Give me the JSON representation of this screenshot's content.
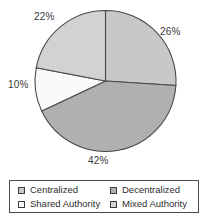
{
  "chart_data": {
    "type": "pie",
    "title": "",
    "categories": [
      "Centralized",
      "Decentralized",
      "Shared Authority",
      "Mixed Authority"
    ],
    "values": [
      26,
      42,
      10,
      22
    ],
    "value_labels": [
      "26%",
      "42%",
      "10%",
      "22%"
    ],
    "unit": "percent",
    "total": 100,
    "start_angle_deg": 0,
    "direction": "clockwise",
    "legend_position": "bottom",
    "legend_columns": 2,
    "grid": false,
    "colors": [
      "#c8c8c8",
      "#b0b0b0",
      "#fafafa",
      "#d2d2d2"
    ],
    "outline_color": "#4a4a4a",
    "slices": [
      {
        "label": "Centralized",
        "value": 26,
        "display": "26%",
        "color": "#c8c8c8"
      },
      {
        "label": "Decentralized",
        "value": 42,
        "display": "42%",
        "color": "#b0b0b0"
      },
      {
        "label": "Shared Authority",
        "value": 10,
        "display": "10%",
        "color": "#fafafa"
      },
      {
        "label": "Mixed Authority",
        "value": 22,
        "display": "22%",
        "color": "#d2d2d2"
      }
    ]
  },
  "legend": {
    "rows": [
      {
        "left": {
          "label": "Centralized",
          "color": "#c8c8c8"
        },
        "right": {
          "label": "Decentralized",
          "color": "#b0b0b0"
        }
      },
      {
        "left": {
          "label": "Shared Authority",
          "color": "#fafafa"
        },
        "right": {
          "label": "Mixed Authority",
          "color": "#d2d2d2"
        }
      }
    ]
  }
}
